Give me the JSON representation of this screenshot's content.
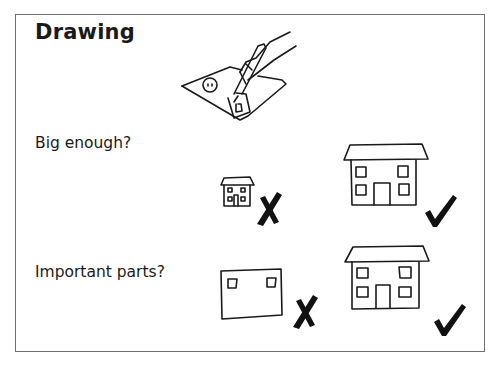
{
  "slide": {
    "title": "Drawing",
    "questions": [
      {
        "label": "Big enough?",
        "bad_example": "small-house-drawing",
        "bad_mark": "cross",
        "good_example": "large-house-drawing",
        "good_mark": "check"
      },
      {
        "label": "Important parts?",
        "bad_example": "house-missing-roof-and-door",
        "bad_mark": "cross",
        "good_example": "complete-house-drawing",
        "good_mark": "check"
      }
    ],
    "illustration": "hand-drawing-on-paper"
  },
  "colors": {
    "ink": "#1a1a1a",
    "frame": "#6e6e6e",
    "background": "#ffffff"
  }
}
